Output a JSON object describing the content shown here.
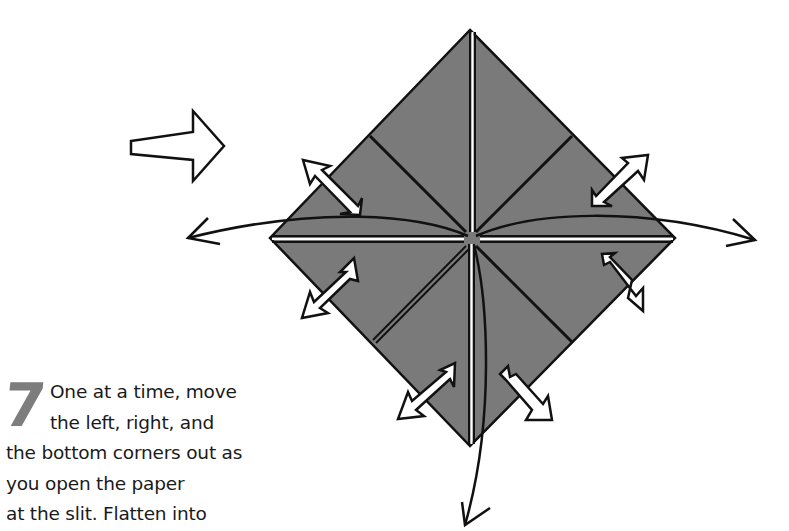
{
  "step": {
    "number": "7",
    "lines": [
      "One at a time, move",
      "the left, right, and",
      "the bottom corners out as",
      "you open the paper",
      "at the slit. Flatten into"
    ]
  },
  "diagram": {
    "paper_color": "#7a7a7a",
    "outline_color": "#111111",
    "arrow_fill": "#ffffff",
    "elements": [
      "direction-arrow-right",
      "square-base-diamond",
      "crease-lines",
      "curved-arrow-left",
      "curved-arrow-right",
      "curved-arrow-down",
      "open-arrow-upper-left",
      "open-arrow-upper-right",
      "open-arrow-lower-left",
      "open-arrow-lower-right",
      "open-arrow-bottom-left",
      "open-arrow-bottom-right"
    ]
  }
}
